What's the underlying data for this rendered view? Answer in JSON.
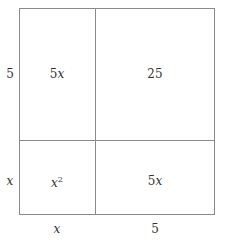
{
  "diagram": {
    "title": "",
    "type": "area-model",
    "side_labels": {
      "left_top": "5",
      "left_bottom": "x",
      "bottom_left": "x",
      "bottom_right": "5"
    },
    "cells": {
      "top_left": {
        "coef": "5",
        "var": "x",
        "text": "5x"
      },
      "top_right": {
        "text": "25"
      },
      "bottom_left": {
        "base": "x",
        "exp": "2",
        "text": "x^2"
      },
      "bottom_right": {
        "coef": "5",
        "var": "x",
        "text": "5x"
      }
    },
    "line_color": "#8a8a8a"
  }
}
